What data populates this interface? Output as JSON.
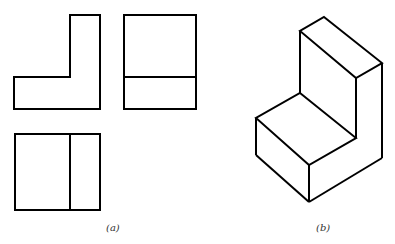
{
  "figure": {
    "panel_a": {
      "label": "(a)",
      "views": [
        {
          "name": "front-view",
          "shape": "L-profile"
        },
        {
          "name": "side-view",
          "shape": "rectangle with horizontal divider"
        },
        {
          "name": "top-view",
          "shape": "rectangle with vertical divider"
        }
      ]
    },
    "panel_b": {
      "label": "(b)",
      "description": "isometric view of L-shaped block"
    },
    "stroke_color": "#000000",
    "background": "#ffffff"
  }
}
